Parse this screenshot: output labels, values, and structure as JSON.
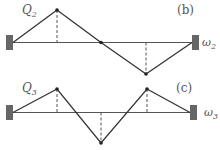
{
  "diagrams": [
    {
      "tag": "(b)",
      "label_left": "Q",
      "label_left_sub": "2",
      "label_right": "ω",
      "label_right_sub": "2",
      "mode_shape": "one node at center; up then down"
    },
    {
      "tag": "(c)",
      "label_left": "Q",
      "label_left_sub": "3",
      "label_right": "ω",
      "label_right_sub": "3",
      "mode_shape": "two nodes; up, down, up"
    }
  ],
  "colors": {
    "line": "#333333",
    "axis": "#555555",
    "wall": "#666666",
    "dash": "#555555"
  }
}
